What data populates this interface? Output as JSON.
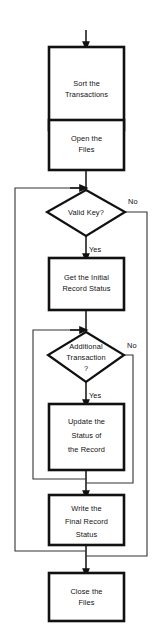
{
  "diagram": {
    "canvas": {
      "width": 156,
      "height": 636
    },
    "colors": {
      "background": "#ffffff",
      "stroke": "#111111",
      "text": "#111111"
    },
    "nodes": [
      {
        "id": "sort-transactions",
        "type": "process",
        "lines": [
          "Sort the",
          "Transactions"
        ]
      },
      {
        "id": "open-files",
        "type": "process",
        "lines": [
          "Open the",
          "Files"
        ]
      },
      {
        "id": "valid-key",
        "type": "decision",
        "lines": [
          "Valid Key?"
        ]
      },
      {
        "id": "get-initial-record-status",
        "type": "process",
        "lines": [
          "Get the Initial",
          "Record Status"
        ]
      },
      {
        "id": "additional-transaction",
        "type": "decision",
        "lines": [
          "Additional",
          "Transaction",
          "?"
        ]
      },
      {
        "id": "update-record-status",
        "type": "process",
        "lines": [
          "Update the",
          "Status of",
          "the Record"
        ]
      },
      {
        "id": "write-final-record-status",
        "type": "process",
        "lines": [
          "Write the",
          "Final Record",
          "Status"
        ]
      },
      {
        "id": "close-files",
        "type": "process",
        "lines": [
          "Close the",
          "Files"
        ]
      }
    ],
    "branch_labels": {
      "valid_key_no": "No",
      "valid_key_yes": "Yes",
      "additional_transaction_no": "No",
      "additional_transaction_yes": "Yes"
    }
  }
}
